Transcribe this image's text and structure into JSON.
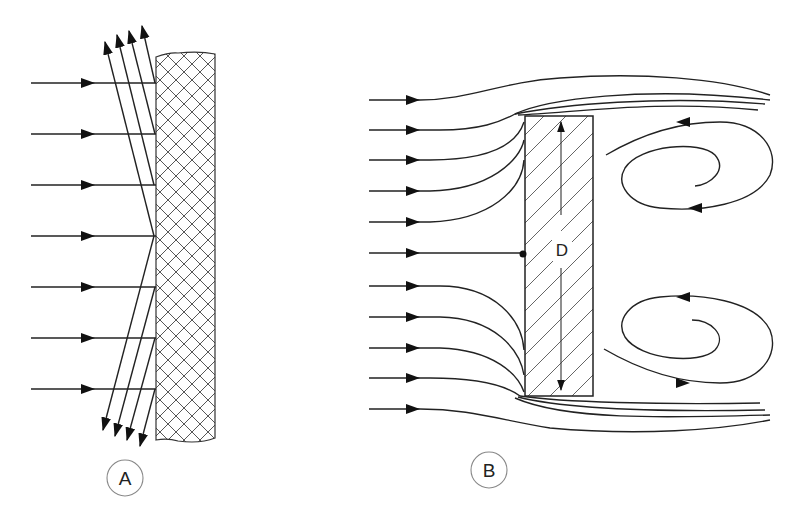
{
  "figure": {
    "panels": [
      {
        "id": "A",
        "label": "A",
        "description": "Parallel horizontal flow arrows striking a cross-hatched flat wall, reflected as deflected rays upward and downward",
        "incoming_arrows": 7,
        "deflected_up_arrows": 4,
        "deflected_down_arrows": 4,
        "wall_fill": "cross-hatch"
      },
      {
        "id": "B",
        "label": "B",
        "description": "Streamlines flowing around a rectangular bluff body with stagnation point and two recirculating wake vortices",
        "incoming_streamlines": 11,
        "body_fill": "diagonal-hatch",
        "dimension_label": "D",
        "vortices": 2
      }
    ],
    "colors": {
      "line": "#222222",
      "label_circle": "#888888",
      "background": "#ffffff"
    }
  }
}
